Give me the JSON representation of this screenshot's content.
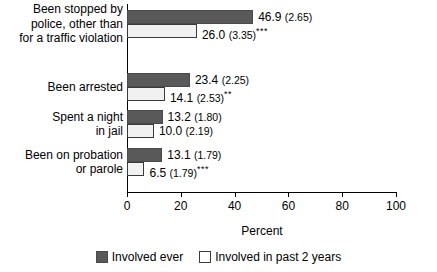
{
  "chart_data": {
    "type": "bar",
    "title": "",
    "xlabel": "Percent",
    "ylabel": "",
    "orientation": "horizontal",
    "xlim": [
      0,
      100
    ],
    "xticks": [
      0,
      20,
      40,
      60,
      80,
      100
    ],
    "xtick_labels": [
      "0",
      "20",
      "40",
      "60",
      "80",
      "100"
    ],
    "grid": false,
    "legend_position": "bottom",
    "categories": [
      "Been stopped by police, other than for a traffic violation",
      "Been arrested",
      "Spent a night in jail",
      "Been on probation or parole"
    ],
    "category_lines": [
      [
        "Been stopped by",
        "police, other than",
        "for a traffic violation"
      ],
      [
        "Been arrested"
      ],
      [
        "Spent a night",
        "in jail"
      ],
      [
        "Been on probation",
        "or parole"
      ]
    ],
    "series": [
      {
        "name": "Involved ever",
        "color": "#595959",
        "values": [
          46.9,
          23.4,
          13.2,
          13.1
        ],
        "std_errors": [
          2.65,
          2.25,
          1.8,
          1.79
        ],
        "significance": [
          "",
          "",
          "",
          ""
        ],
        "labels": [
          "46.9 (2.65)",
          "23.4 (2.25)",
          "13.2 (1.80)",
          "13.1 (1.79)"
        ]
      },
      {
        "name": "Involved in past 2 years",
        "color": "#f1f1f1",
        "values": [
          26.0,
          14.1,
          10.0,
          6.5
        ],
        "std_errors": [
          3.35,
          2.53,
          2.19,
          1.79
        ],
        "significance": [
          "***",
          "**",
          "",
          "***"
        ],
        "labels": [
          "26.0 (3.35)***",
          "14.1 (2.53)**",
          "10.0 (2.19)",
          "6.5 (1.79)***"
        ]
      }
    ]
  },
  "legend": {
    "items": [
      {
        "label": "Involved ever",
        "swatch": "dark-gray-swatch"
      },
      {
        "label": "Involved in past 2 years",
        "swatch": "white-swatch"
      }
    ]
  },
  "axis": {
    "x_title": "Percent"
  }
}
